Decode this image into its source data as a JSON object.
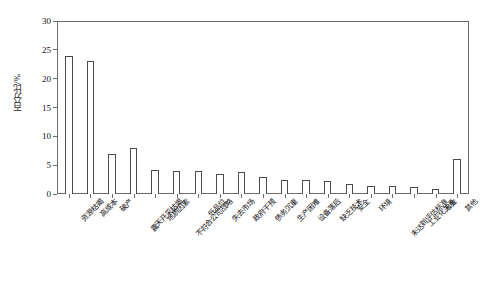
{
  "chart_data": {
    "type": "bar",
    "title": "",
    "subtitle": "",
    "xlabel": "",
    "ylabel": "百分比/%",
    "ylim": [
      0,
      30
    ],
    "ytick_step": 5,
    "yticks": [
      "0",
      "5",
      "10",
      "15",
      "20",
      "25",
      "30"
    ],
    "grid": false,
    "legend": false,
    "bar_style": {
      "fill": "#ffffff",
      "edge": "#4b4b4b"
    },
    "categories": [
      "资源枯竭",
      "高成本",
      "破产",
      "露天开采枯竭",
      "地质因素",
      "不符合公司战略",
      "低品位",
      "失去市场",
      "政府干预",
      "债务沉重",
      "生产困难",
      "设备落后",
      "缺乏技术",
      "安全",
      "环境",
      "未达到评估标准",
      "工业化关系",
      "冶金",
      "其他"
    ],
    "values": [
      24,
      23,
      7,
      8,
      4.2,
      4,
      4,
      3.4,
      3.8,
      3,
      2.4,
      2.4,
      2.2,
      1.8,
      1.4,
      1.4,
      1.2,
      0.8,
      6
    ]
  },
  "axis": {
    "y_label_text": "百分比/%"
  }
}
